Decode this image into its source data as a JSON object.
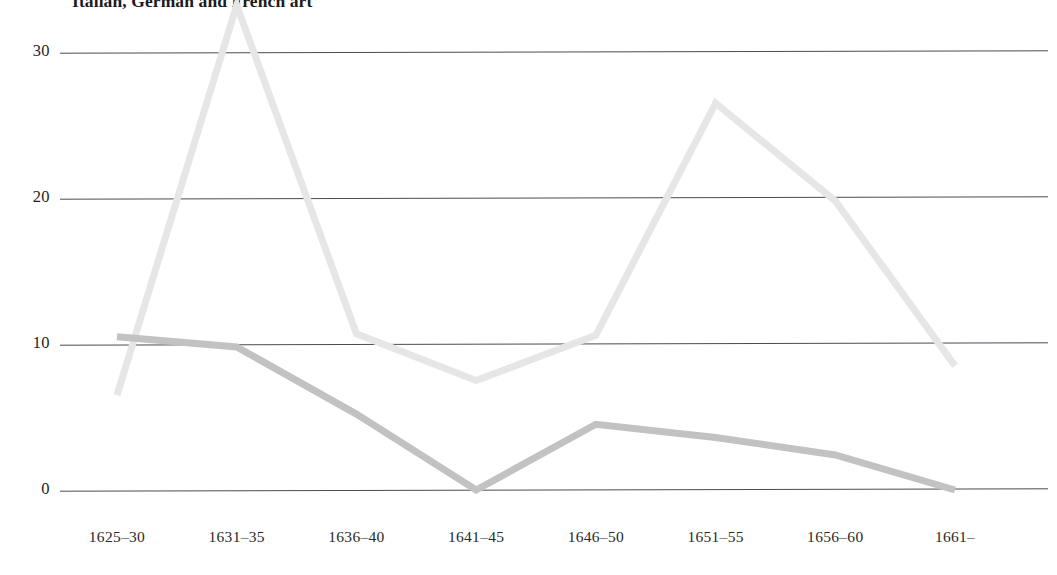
{
  "chart_data": {
    "type": "line",
    "title": "Italian, German and French art",
    "xlabel": "",
    "ylabel": "",
    "categories": [
      "1625–30",
      "1631–35",
      "1636–40",
      "1641–45",
      "1646–50",
      "1651–55",
      "1656–60",
      "1661–"
    ],
    "series": [
      {
        "name": "light-series",
        "color": "#e6e6e6",
        "values": [
          6.5,
          33.2,
          10.7,
          7.5,
          10.6,
          26.5,
          19.8,
          8.5
        ]
      },
      {
        "name": "dark-series",
        "color": "#c2c2c2",
        "values": [
          10.5,
          9.8,
          5.2,
          0.0,
          4.5,
          3.6,
          2.4,
          0.0
        ]
      }
    ],
    "yticks": [
      0,
      10,
      20,
      30
    ],
    "ytick_labels": [
      "0",
      "10",
      "20",
      "30"
    ],
    "ylim": [
      0,
      30
    ],
    "xlim_note": "categorical, evenly spaced",
    "grid": true,
    "grid_color": "#4a4a55",
    "legend": "none",
    "legend_position": "none",
    "background": "#ffffff"
  },
  "axis": {
    "y_labels": [
      "30",
      "20",
      "10",
      "0"
    ],
    "x_labels": [
      "1625–30",
      "1631–35",
      "1636–40",
      "1641–45",
      "1646–50",
      "1651–55",
      "1656–60",
      "1661–"
    ]
  },
  "title": {
    "text": "Italian, German and French art"
  }
}
